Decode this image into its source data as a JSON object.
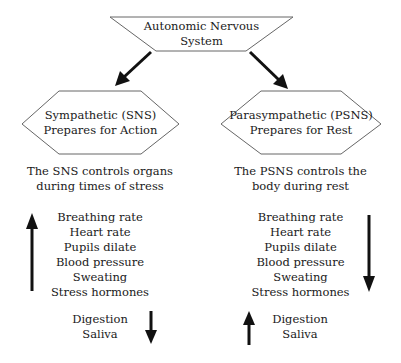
{
  "root": {
    "title_line1": "Autonomic Nervous",
    "title_line2": "System"
  },
  "sns": {
    "title_line1": "Sympathetic (SNS)",
    "title_line2": "Prepares for Action",
    "desc_line1": "The SNS controls organs",
    "desc_line2": "during times of stress",
    "increase_items": [
      "Breathing rate",
      "Heart rate",
      "Pupils dilate",
      "Blood pressure",
      "Sweating",
      "Stress hormones"
    ],
    "increase_direction": "up",
    "decrease_items": [
      "Digestion",
      "Saliva"
    ],
    "decrease_direction": "down"
  },
  "psns": {
    "title_line1": "Parasympathetic (PSNS)",
    "title_line2": "Prepares for Rest",
    "desc_line1": "The PSNS controls the",
    "desc_line2": "body during rest",
    "decrease_items": [
      "Breathing rate",
      "Heart rate",
      "Pupils dilate",
      "Blood pressure",
      "Sweating",
      "Stress hormones"
    ],
    "decrease_direction": "down",
    "increase_items": [
      "Digestion",
      "Saliva"
    ],
    "increase_direction": "up"
  },
  "colors": {
    "stroke": "#555555",
    "arrow": "#111111",
    "text": "#1a1a1a"
  }
}
